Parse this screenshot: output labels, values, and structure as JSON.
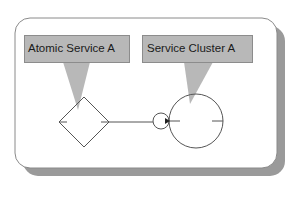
{
  "diagram": {
    "callouts": [
      {
        "id": "atomic-service",
        "label": "Atomic Service A"
      },
      {
        "id": "service-cluster",
        "label": "Service Cluster A"
      }
    ],
    "shapes": {
      "atomic_service": {
        "type": "diamond"
      },
      "connector": {
        "type": "line"
      },
      "interface": {
        "type": "small-circle"
      },
      "service_cluster": {
        "type": "circle"
      }
    },
    "colors": {
      "background": "#ffffff",
      "panel_border": "#8a8a8a",
      "panel_shadow": "#9a9a9a",
      "callout_fill": "#b8b8b8",
      "callout_border": "#8c8c8c",
      "stroke": "#555555"
    }
  }
}
